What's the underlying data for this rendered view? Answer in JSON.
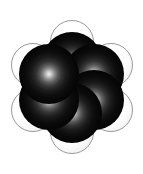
{
  "image": {
    "subject": "benzene",
    "formula": "C6H6",
    "representation": "space-filling CPK model",
    "width": 143,
    "height": 174,
    "background_color": "#ffffff"
  },
  "colors": {
    "background": "#ffffff",
    "carbon": "#000000",
    "carbon_highlight": "#f2f2f2",
    "hydrogen": "#ffffff",
    "hydrogen_outline": "#9a9a9a",
    "hydrogen_shadow": "#d8d8d8"
  },
  "ring": {
    "center_x": 71.5,
    "center_y": 87,
    "carbon_radius": 30,
    "carbon_orbit_radius": 25.5,
    "hydrogen_radius": 22,
    "hydrogen_orbit_radius": 45
  },
  "atoms": {
    "carbon": [
      {
        "label": "C1",
        "position": "top",
        "cx": 71.5,
        "cy": 61.5,
        "r": 30
      },
      {
        "label": "C2",
        "position": "upper-right",
        "cx": 93.6,
        "cy": 74.3,
        "r": 30
      },
      {
        "label": "C3",
        "position": "lower-right",
        "cx": 93.6,
        "cy": 99.7,
        "r": 30
      },
      {
        "label": "C4",
        "position": "bottom",
        "cx": 71.5,
        "cy": 112.5,
        "r": 30
      },
      {
        "label": "C5",
        "position": "lower-left",
        "cx": 49.4,
        "cy": 99.7,
        "r": 30
      },
      {
        "label": "C6",
        "position": "upper-left",
        "cx": 49.4,
        "cy": 74.3,
        "r": 30
      }
    ],
    "hydrogen": [
      {
        "label": "H1",
        "position": "top",
        "cx": 71.5,
        "cy": 42.0,
        "r": 22
      },
      {
        "label": "H2",
        "position": "upper-right",
        "cx": 110.5,
        "cy": 64.5,
        "r": 22
      },
      {
        "label": "H3",
        "position": "lower-right",
        "cx": 110.5,
        "cy": 109.5,
        "r": 22
      },
      {
        "label": "H4",
        "position": "bottom",
        "cx": 71.5,
        "cy": 132.0,
        "r": 22
      },
      {
        "label": "H5",
        "position": "lower-left",
        "cx": 32.5,
        "cy": 109.5,
        "r": 22
      },
      {
        "label": "H6",
        "position": "upper-left",
        "cx": 32.5,
        "cy": 64.5,
        "r": 22
      }
    ]
  }
}
